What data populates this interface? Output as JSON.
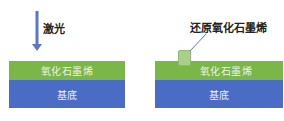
{
  "diagram": {
    "left_panel": {
      "arrow_label": "激光",
      "arrow_color": "#5b76c4",
      "layers": [
        {
          "name": "graphene-oxide",
          "label": "氧化石墨烯",
          "color": "#7ab648"
        },
        {
          "name": "substrate",
          "label": "基底",
          "color": "#4a6cc4"
        }
      ]
    },
    "right_panel": {
      "callout_label": "还原氧化石墨烯",
      "callout_line_color": "#5b76c4",
      "patch_color": "#a9cf8a",
      "layers": [
        {
          "name": "graphene-oxide",
          "label": "氧化石墨烯",
          "color": "#7ab648"
        },
        {
          "name": "substrate",
          "label": "基底",
          "color": "#4a6cc4"
        }
      ]
    }
  }
}
